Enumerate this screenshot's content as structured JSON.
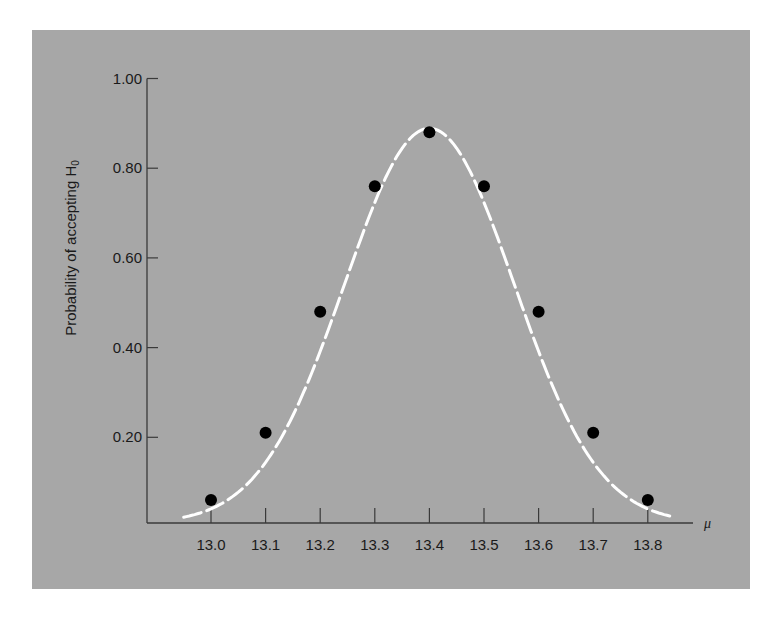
{
  "chart_data": {
    "type": "scatter",
    "title": "",
    "xlabel": "μ",
    "ylabel": "Probability of accepting H",
    "ylabel_subscript": "0",
    "x": [
      13.0,
      13.1,
      13.2,
      13.3,
      13.4,
      13.5,
      13.6,
      13.7,
      13.8
    ],
    "values": [
      0.06,
      0.21,
      0.48,
      0.76,
      0.88,
      0.76,
      0.48,
      0.21,
      0.06
    ],
    "xticks": [
      "13.0",
      "13.1",
      "13.2",
      "13.3",
      "13.4",
      "13.5",
      "13.6",
      "13.7",
      "13.8"
    ],
    "yticks": [
      "0.20",
      "0.40",
      "0.60",
      "0.80",
      "1.00"
    ],
    "ylim": [
      0,
      1.0
    ],
    "xlim": [
      12.9,
      13.9
    ],
    "grid": false,
    "legend": null,
    "curve": {
      "style": "dashed",
      "color": "#ffffff",
      "description": "smooth bell-shaped operating characteristic curve through points"
    },
    "marker_color": "#000000",
    "background_color": "#a7a7a7"
  }
}
